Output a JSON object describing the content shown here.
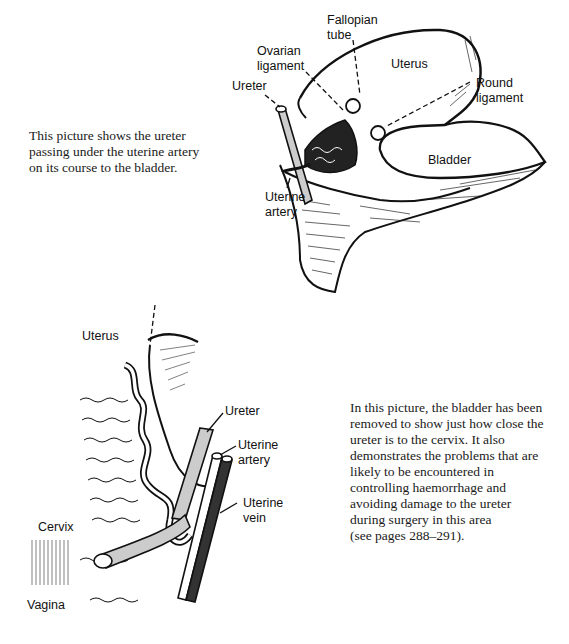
{
  "page": {
    "background": "#ffffff",
    "ink_color": "#111111"
  },
  "figure_1": {
    "caption": [
      "This picture shows the ureter",
      "passing under the uterine artery",
      "on its course to the bladder."
    ],
    "labels": {
      "fallopian_tube": [
        "Fallopian",
        "tube"
      ],
      "ovarian_ligament": [
        "Ovarian",
        "ligament"
      ],
      "uterus": "Uterus",
      "ureter": "Ureter",
      "round_ligament": [
        "Round",
        "ligament"
      ],
      "bladder": "Bladder",
      "uterine_artery": [
        "Uterine",
        "artery"
      ]
    }
  },
  "figure_2": {
    "caption": [
      "In this picture, the bladder has been",
      "removed to show just how close the",
      "ureter is to the cervix. It also",
      "demonstrates the problems that are",
      "likely to be encountered in",
      "controlling haemorrhage and",
      "avoiding damage to the ureter",
      "during surgery in this area",
      "(see pages 288–291)."
    ],
    "labels": {
      "uterus": "Uterus",
      "ureter": "Ureter",
      "uterine_artery": [
        "Uterine",
        "artery"
      ],
      "uterine_vein": [
        "Uterine",
        "vein"
      ],
      "cervix": "Cervix",
      "vagina": "Vagina"
    }
  }
}
